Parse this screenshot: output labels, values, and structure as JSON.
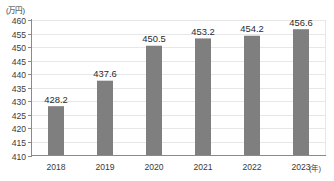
{
  "chart_data": {
    "type": "bar",
    "title": "",
    "subtitle": "",
    "xlabel": "(年)",
    "ylabel": "(万円)",
    "categories": [
      "2018",
      "2019",
      "2020",
      "2021",
      "2022",
      "2023"
    ],
    "values": [
      428.2,
      437.6,
      450.5,
      453.2,
      454.2,
      456.6
    ],
    "data_labels": [
      "428.2",
      "437.6",
      "450.5",
      "453.2",
      "454.2",
      "456.6"
    ],
    "ylim": [
      410,
      460
    ],
    "ytick_values": [
      410,
      415,
      420,
      425,
      430,
      435,
      440,
      445,
      450,
      455,
      460
    ],
    "ytick_labels": [
      "410",
      "415",
      "420",
      "425",
      "430",
      "435",
      "440",
      "445",
      "450",
      "455",
      "460"
    ],
    "grid": true,
    "grid_axis": "y",
    "legend": false,
    "legend_position": "none",
    "series": [
      {
        "name": "",
        "values": [
          428.2,
          437.6,
          450.5,
          453.2,
          454.2,
          456.6
        ]
      }
    ],
    "colors": {
      "bar": "#7f7f7f",
      "gridline": "#e4e4e4",
      "axis": "#8a8a8a",
      "text": "#333333",
      "background": "#ffffff"
    }
  }
}
